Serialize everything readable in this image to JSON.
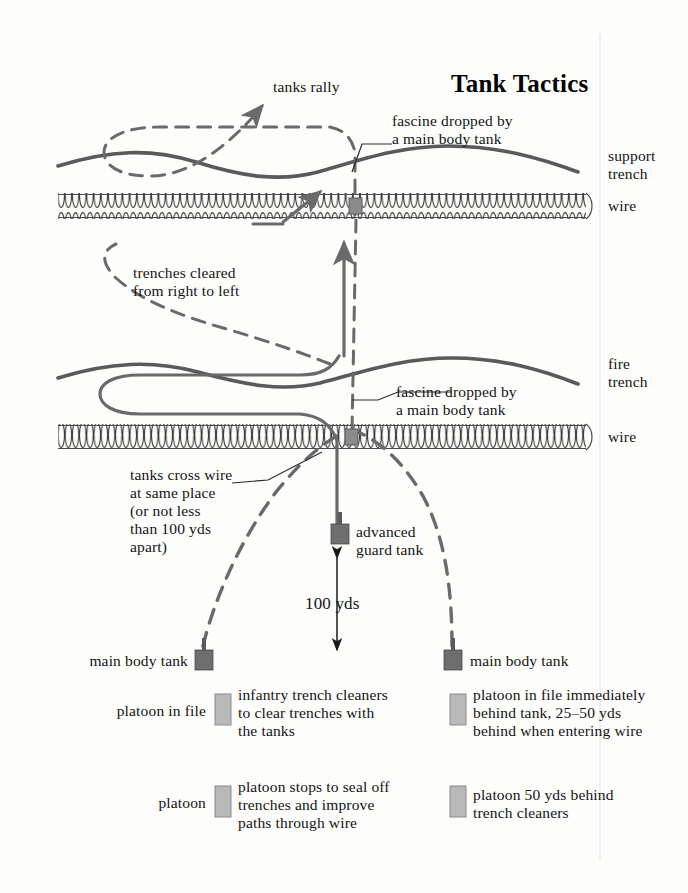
{
  "title": "Tank Tactics",
  "colors": {
    "background": "#fdfdfb",
    "trench_line": "#5a5a5a",
    "dashed_path": "#6a6a6a",
    "solid_path": "#6a6a6a",
    "wire": "#3f3f3f",
    "tank_symbol": "#6e6e6e",
    "platoon_symbol": "#b5b5b5",
    "text": "#141414"
  },
  "annotations": {
    "tanks_rally": "tanks rally",
    "fascine_top": "fascine dropped by\na main body tank",
    "support_trench": "support\ntrench",
    "wire_top": "wire",
    "trenches_cleared": "trenches cleared\nfrom right to left",
    "fire_trench": "fire\ntrench",
    "fascine_mid": "fascine dropped by\na main body tank",
    "wire_mid": "wire",
    "tanks_cross_wire": "tanks cross wire\nat same place\n(or not less\nthan 100 yds\napart)",
    "advanced_guard_tank": "advanced\nguard tank",
    "distance_100yds": "100 yds",
    "main_body_tank_left": "main body tank",
    "main_body_tank_right": "main body tank"
  },
  "legend": [
    {
      "id": "legend-row-1-left",
      "left_label": "platoon in file",
      "right_label": "infantry trench cleaners\nto clear trenches with\nthe tanks"
    },
    {
      "id": "legend-row-1-right",
      "left_label": "",
      "right_label": "platoon in file immediately\nbehind tank, 25–50 yds\nbehind when entering wire"
    },
    {
      "id": "legend-row-2-left",
      "left_label": "platoon",
      "right_label": "platoon stops to seal off\ntrenches and improve\npaths through wire"
    },
    {
      "id": "legend-row-2-right",
      "left_label": "",
      "right_label": "platoon 50 yds behind\ntrench cleaners"
    }
  ]
}
